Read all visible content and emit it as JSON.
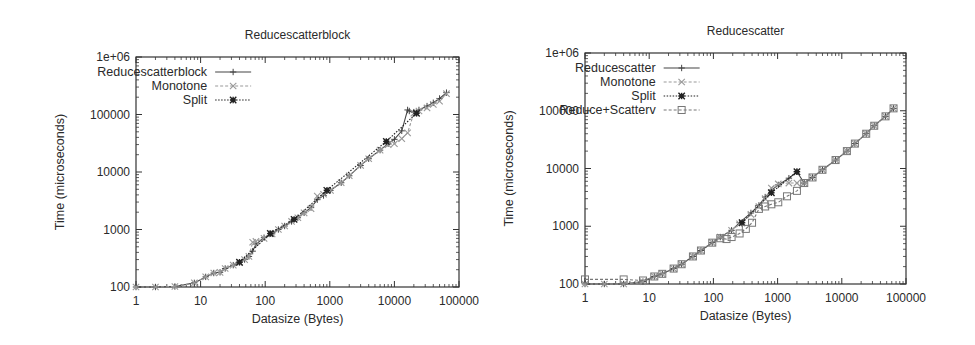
{
  "chart_data": [
    {
      "type": "line",
      "title": "Reducescatterblock",
      "xlabel": "Datasize (Bytes)",
      "ylabel": "Time (microseconds)",
      "xscale": "log",
      "yscale": "log",
      "xlim": [
        1,
        100000
      ],
      "ylim": [
        100,
        1000000
      ],
      "xticks": [
        "1",
        "10",
        "100",
        "1000",
        "10000",
        "100000"
      ],
      "yticks": [
        "100",
        "1000",
        "10000",
        "100000",
        "1e+06"
      ],
      "grid": false,
      "legend_position": "top-left",
      "series": [
        {
          "name": "Reducescatterblock",
          "style": "solid",
          "marker": "plus",
          "color": "#444444",
          "x": [
            1,
            2,
            4,
            8,
            12,
            16,
            20,
            24,
            32,
            40,
            48,
            56,
            64,
            72,
            96,
            128,
            160,
            200,
            256,
            320,
            400,
            512,
            640,
            800,
            1024,
            1500,
            2000,
            3000,
            4000,
            6000,
            8000,
            10000,
            13000,
            16000,
            17000,
            20000,
            24000,
            32000,
            40000,
            50000,
            64000
          ],
          "y": [
            100,
            100,
            102,
            118,
            150,
            175,
            180,
            210,
            240,
            270,
            300,
            340,
            420,
            560,
            720,
            840,
            1000,
            1150,
            1380,
            1600,
            1950,
            2400,
            3300,
            3900,
            4800,
            6500,
            8600,
            13000,
            17000,
            24000,
            31000,
            37000,
            52000,
            120000,
            115000,
            110000,
            120000,
            140000,
            160000,
            190000,
            240000
          ]
        },
        {
          "name": "Monotone",
          "style": "dashed",
          "marker": "x",
          "color": "#999999",
          "x": [
            1,
            2,
            4,
            8,
            12,
            16,
            20,
            24,
            32,
            40,
            48,
            56,
            64,
            72,
            96,
            128,
            160,
            200,
            256,
            320,
            400,
            512,
            640,
            800,
            1024,
            1500,
            2000,
            3000,
            4000,
            6000,
            8000,
            10000,
            13000,
            16000,
            20000,
            24000,
            32000,
            40000,
            50000,
            64000
          ],
          "y": [
            100,
            100,
            102,
            118,
            150,
            175,
            180,
            210,
            240,
            265,
            300,
            340,
            600,
            620,
            700,
            840,
            1000,
            1150,
            1380,
            1600,
            1950,
            2300,
            3800,
            4100,
            4800,
            6500,
            8600,
            13000,
            17000,
            24000,
            30000,
            31000,
            38000,
            48000,
            105000,
            115000,
            130000,
            150000,
            170000,
            230000
          ]
        },
        {
          "name": "Split",
          "style": "dotted",
          "marker": "star",
          "color": "#222222",
          "x": [
            40,
            120,
            280,
            900,
            7500,
            22000
          ],
          "y": [
            270,
            850,
            1500,
            4800,
            34000,
            105000
          ]
        }
      ]
    },
    {
      "type": "line",
      "title": "Reducescatter",
      "xlabel": "Datasize (Bytes)",
      "ylabel": "Time (microseconds)",
      "xscale": "log",
      "yscale": "log",
      "xlim": [
        1,
        100000
      ],
      "ylim": [
        100,
        1000000
      ],
      "xticks": [
        "1",
        "10",
        "100",
        "1000",
        "10000",
        "100000"
      ],
      "yticks": [
        "100",
        "1000",
        "10000",
        "100000",
        "1e+06"
      ],
      "grid": false,
      "legend_position": "top-left",
      "series": [
        {
          "name": "Reducescatter",
          "style": "solid",
          "marker": "plus",
          "color": "#444444",
          "x": [
            1,
            2,
            4,
            8,
            12,
            16,
            24,
            32,
            48,
            64,
            96,
            128,
            192,
            256,
            384,
            512,
            640,
            800,
            1024,
            1500,
            2000,
            2600,
            3500,
            5000,
            8000,
            12000,
            16000,
            24000,
            32000,
            48000,
            64000
          ],
          "y": [
            100,
            100,
            100,
            110,
            135,
            150,
            185,
            220,
            300,
            380,
            520,
            650,
            850,
            1150,
            1700,
            2300,
            3200,
            4200,
            5200,
            6800,
            8800,
            5600,
            7000,
            9500,
            14000,
            20000,
            27000,
            40000,
            55000,
            80000,
            110000
          ]
        },
        {
          "name": "Monotone",
          "style": "dashed",
          "marker": "x",
          "color": "#999999",
          "x": [
            1,
            2,
            4,
            8,
            12,
            16,
            24,
            32,
            48,
            64,
            96,
            128,
            192,
            256,
            384,
            512,
            640,
            800,
            1024,
            1500,
            2000,
            2600,
            3500,
            5000,
            8000,
            12000,
            16000,
            24000,
            32000,
            48000,
            64000
          ],
          "y": [
            100,
            100,
            100,
            110,
            135,
            150,
            185,
            220,
            300,
            380,
            520,
            650,
            850,
            1100,
            1600,
            2200,
            3000,
            4600,
            5400,
            5600,
            5600,
            5600,
            7000,
            9500,
            14000,
            20000,
            27000,
            40000,
            55000,
            80000,
            110000
          ]
        },
        {
          "name": "Split",
          "style": "dotted",
          "marker": "star",
          "color": "#222222",
          "x": [
            280,
            800,
            2000
          ],
          "y": [
            1150,
            3800,
            8800
          ]
        },
        {
          "name": "Reduce+Scatterv",
          "style": "dashed",
          "marker": "square",
          "color": "#777777",
          "x": [
            1,
            4,
            8,
            12,
            16,
            24,
            32,
            48,
            64,
            96,
            128,
            160,
            192,
            256,
            320,
            400,
            512,
            640,
            800,
            1024,
            1400,
            2000,
            2600,
            3500,
            5000,
            8000,
            12000,
            16000,
            24000,
            32000,
            48000,
            64000
          ],
          "y": [
            120,
            120,
            115,
            135,
            150,
            185,
            220,
            300,
            380,
            520,
            620,
            600,
            650,
            750,
            900,
            1150,
            2000,
            2200,
            2400,
            2600,
            3300,
            4100,
            5600,
            7000,
            9500,
            14000,
            20000,
            27000,
            40000,
            55000,
            80000,
            110000
          ]
        }
      ]
    }
  ]
}
